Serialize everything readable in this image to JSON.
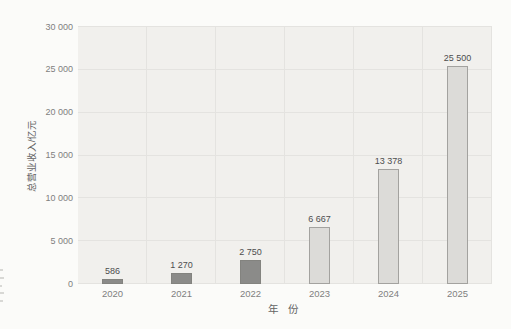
{
  "chart_data": {
    "type": "bar",
    "title": "",
    "xlabel": "年 份",
    "ylabel": "总营业收入/亿元",
    "categories": [
      "2020",
      "2021",
      "2022",
      "2023",
      "2024",
      "2025"
    ],
    "values": [
      586,
      1270,
      2750,
      6667,
      13378,
      25500
    ],
    "value_labels": [
      "586",
      "1 270",
      "2 750",
      "6 667",
      "13 378",
      "25 500"
    ],
    "ylim": [
      0,
      30000
    ],
    "ytick_step": 5000,
    "ytick_labels": [
      "0",
      "5 000",
      "10 000",
      "15 000",
      "20 000",
      "25 000",
      "30 000"
    ],
    "grid": true,
    "legend": "none",
    "bar_colors": [
      {
        "fill": "#8b8b89",
        "border": "#83837f"
      },
      {
        "fill": "#8b8b89",
        "border": "#83837f"
      },
      {
        "fill": "#8b8b89",
        "border": "#83837f"
      },
      {
        "fill": "#dcdbd8",
        "border": "#a3a29f"
      },
      {
        "fill": "#dcdbd8",
        "border": "#a3a29f"
      },
      {
        "fill": "#dcdbd8",
        "border": "#a3a29f"
      }
    ]
  },
  "style": {
    "page_bg": "#fbfbf9",
    "plot_bg": "#f1f0ed",
    "grid_color": "#e4e3e0",
    "tick_label_color": "#7f7f7f",
    "data_label_color": "#4d4d4d",
    "axis_title_color": "#636363"
  }
}
